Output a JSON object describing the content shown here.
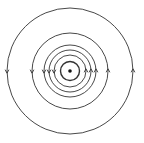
{
  "diagram": {
    "title": "",
    "center": [
      70,
      71
    ],
    "wire": {
      "symbol": "dot",
      "radius": 1.8
    },
    "field_lines": [
      {
        "radius": 9.5,
        "stroke_width": 1.4,
        "arrows": false
      },
      {
        "radius": 16,
        "stroke_width": 0.9,
        "arrows": true
      },
      {
        "radius": 21,
        "stroke_width": 0.9,
        "arrows": true
      },
      {
        "radius": 26,
        "stroke_width": 0.9,
        "arrows": true
      },
      {
        "radius": 38,
        "stroke_width": 0.9,
        "arrows": true
      },
      {
        "radius": 63,
        "stroke_width": 0.9,
        "arrows": true
      }
    ],
    "direction": "counterclockwise",
    "colors": {
      "line": "#333333",
      "background": "#ffffff"
    }
  }
}
